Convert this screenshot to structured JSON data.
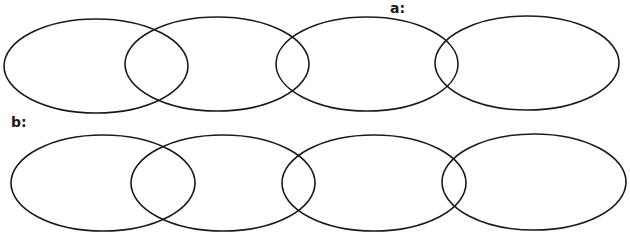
{
  "diagram": {
    "type": "overlapping-ellipse-chains",
    "stroke_color": "#1a1a1a",
    "background": "#ffffff",
    "rows": [
      {
        "label": "a:",
        "label_pos": {
          "x": 390,
          "y": 1
        },
        "ellipses": [
          {
            "cx": 96,
            "cy": 66,
            "rx": 92,
            "ry": 47
          },
          {
            "cx": 217,
            "cy": 64,
            "rx": 92,
            "ry": 47
          },
          {
            "cx": 367,
            "cy": 64,
            "rx": 91,
            "ry": 47
          },
          {
            "cx": 527,
            "cy": 63,
            "rx": 92,
            "ry": 47
          }
        ]
      },
      {
        "label": "b:",
        "label_pos": {
          "x": 11,
          "y": 115
        },
        "ellipses": [
          {
            "cx": 103,
            "cy": 183,
            "rx": 92,
            "ry": 48
          },
          {
            "cx": 223,
            "cy": 183,
            "rx": 92,
            "ry": 48
          },
          {
            "cx": 374,
            "cy": 183,
            "rx": 92,
            "ry": 48
          },
          {
            "cx": 534,
            "cy": 182,
            "rx": 92,
            "ry": 48
          }
        ]
      }
    ]
  }
}
